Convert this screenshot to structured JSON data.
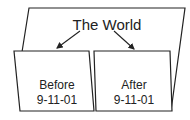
{
  "diagram": {
    "title": "The World",
    "panels": [
      {
        "line1": "Before",
        "line2": "9-11-01"
      },
      {
        "line1": "After",
        "line2": "9-11-01"
      }
    ],
    "colors": {
      "stroke": "#222222",
      "background": "#ffffff"
    }
  }
}
